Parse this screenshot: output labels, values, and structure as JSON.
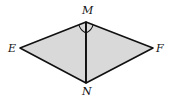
{
  "diagram": {
    "type": "geometry-figure",
    "fill_color": "#d9d9d9",
    "stroke_color": "#111111",
    "points": {
      "M": {
        "label": "M",
        "x": 86,
        "y": 22
      },
      "E": {
        "label": "E",
        "x": 20,
        "y": 48
      },
      "F": {
        "label": "F",
        "x": 153,
        "y": 48
      },
      "N": {
        "label": "N",
        "x": 86,
        "y": 83
      }
    },
    "segments": [
      "ME",
      "EN",
      "MF",
      "FN",
      "MN"
    ],
    "angle_marks": [
      {
        "vertex": "M",
        "between": [
          "E",
          "N"
        ],
        "ticks": 1
      },
      {
        "vertex": "M",
        "between": [
          "N",
          "F"
        ],
        "ticks": 1
      }
    ]
  }
}
